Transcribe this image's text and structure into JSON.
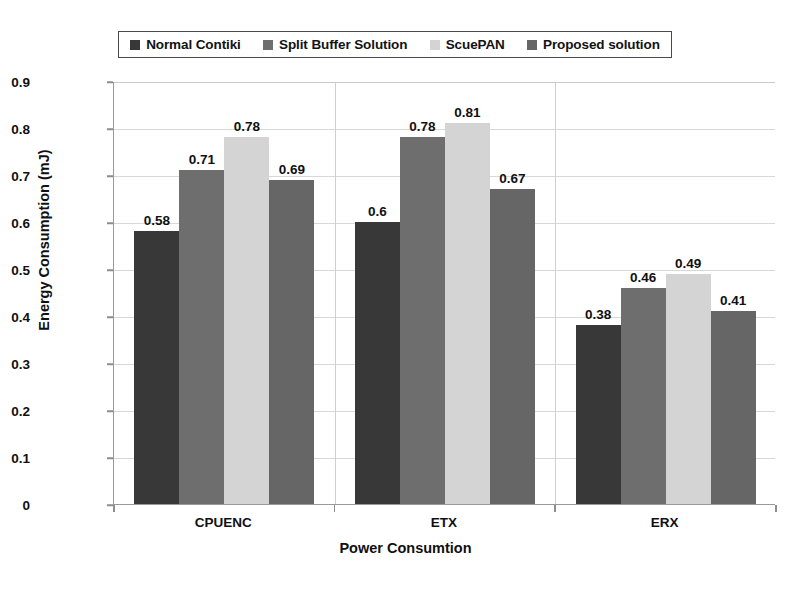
{
  "chart_data": {
    "type": "bar",
    "title": "",
    "subtitle": "",
    "xlabel": "Power Consumtion",
    "ylabel": "Energy Consumption (mJ)",
    "categories": [
      "CPUENC",
      "ETX",
      "ERX"
    ],
    "series": [
      {
        "name": "Normal Contiki",
        "values": [
          0.58,
          0.6,
          0.38
        ],
        "color": "#383838"
      },
      {
        "name": "Split Buffer Solution",
        "values": [
          0.71,
          0.78,
          0.46
        ],
        "color": "#6e6e6e"
      },
      {
        "name": "ScuePAN",
        "values": [
          0.78,
          0.81,
          0.49
        ],
        "color": "#d4d4d4"
      },
      {
        "name": "Proposed solution",
        "values": [
          0.69,
          0.67,
          0.41
        ],
        "color": "#666666"
      }
    ],
    "value_labels": [
      [
        "0.58",
        "0.71",
        "0.78",
        "0.69"
      ],
      [
        "0.6",
        "0.78",
        "0.81",
        "0.67"
      ],
      [
        "0.38",
        "0.46",
        "0.49",
        "0.41"
      ]
    ],
    "ylim": [
      0,
      0.9
    ],
    "ytick_labels": [
      "0.9",
      "0.8",
      "0.7",
      "0.6",
      "0.5",
      "0.4",
      "0.3",
      "0.2",
      "0.1",
      "0"
    ],
    "ytick_values": [
      0.9,
      0.8,
      0.7,
      0.6,
      0.5,
      0.4,
      0.3,
      0.2,
      0.1,
      0
    ],
    "grid": true,
    "legend_position": "top",
    "background": "#ffffff",
    "grid_color": "#d8d8d8",
    "axis_color": "#9a9a9a"
  }
}
